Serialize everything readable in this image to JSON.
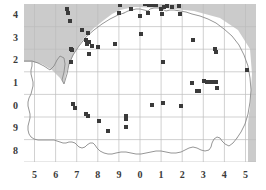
{
  "figure": {
    "type": "distribution-map"
  },
  "chart_data": {
    "type": "scatter",
    "title": "",
    "xlabel": "",
    "ylabel": "",
    "xlim": [
      4.5,
      15.5
    ],
    "ylim": [
      7.5,
      14.5
    ],
    "grid": true,
    "legend": null,
    "xtick_labels": [
      "5",
      "6",
      "7",
      "8",
      "9",
      "0",
      "1",
      "2",
      "3",
      "4",
      "5"
    ],
    "xtick_values": [
      5,
      6,
      7,
      8,
      9,
      10,
      11,
      12,
      13,
      14,
      15
    ],
    "ytick_labels": [
      "4",
      "3",
      "2",
      "1",
      "0",
      "9",
      "8"
    ],
    "ytick_values": [
      14,
      13,
      12,
      11,
      10,
      9,
      8
    ],
    "marker": "square",
    "marker_color": "#3a3a3a",
    "marker_size_px": 4,
    "sea_color": "#cccccc",
    "land_color": "#ffffff",
    "coast_color": "#808080",
    "grid_color": "#bcbcbc",
    "points": [
      [
        6.55,
        14.3
      ],
      [
        6.6,
        14.08
      ],
      [
        6.7,
        13.75
      ],
      [
        7.25,
        13.35
      ],
      [
        7.55,
        13.22
      ],
      [
        7.45,
        12.9
      ],
      [
        7.6,
        12.82
      ],
      [
        7.5,
        12.72
      ],
      [
        7.72,
        12.62
      ],
      [
        6.72,
        12.52
      ],
      [
        8.0,
        12.58
      ],
      [
        8.8,
        12.72
      ],
      [
        6.78,
        12.45
      ],
      [
        6.75,
        11.92
      ],
      [
        7.58,
        12.3
      ],
      [
        9.0,
        14.08
      ],
      [
        9.05,
        14.45
      ],
      [
        9.55,
        14.3
      ],
      [
        10.22,
        14.48
      ],
      [
        10.45,
        14.46
      ],
      [
        10.6,
        14.45
      ],
      [
        10.75,
        14.45
      ],
      [
        10.4,
        14.1
      ],
      [
        10.0,
        13.98
      ],
      [
        11.0,
        14.3
      ],
      [
        11.15,
        14.35
      ],
      [
        11.3,
        14.4
      ],
      [
        11.5,
        14.38
      ],
      [
        11.05,
        14.05
      ],
      [
        11.85,
        14.4
      ],
      [
        11.9,
        14.05
      ],
      [
        10.05,
        13.18
      ],
      [
        12.5,
        12.92
      ],
      [
        13.55,
        12.5
      ],
      [
        13.58,
        12.38
      ],
      [
        11.1,
        11.92
      ],
      [
        15.05,
        11.58
      ],
      [
        12.45,
        11.0
      ],
      [
        13.05,
        11.1
      ],
      [
        13.2,
        11.05
      ],
      [
        13.35,
        11.05
      ],
      [
        13.5,
        11.05
      ],
      [
        13.6,
        11.05
      ],
      [
        13.65,
        10.78
      ],
      [
        12.7,
        10.65
      ],
      [
        12.8,
        10.65
      ],
      [
        10.55,
        10.02
      ],
      [
        11.1,
        10.12
      ],
      [
        11.95,
        10.0
      ],
      [
        6.8,
        10.05
      ],
      [
        6.9,
        9.88
      ],
      [
        7.45,
        9.62
      ],
      [
        7.55,
        9.55
      ],
      [
        8.05,
        9.32
      ],
      [
        9.35,
        9.55
      ],
      [
        9.35,
        9.42
      ],
      [
        9.35,
        9.05
      ],
      [
        8.5,
        8.88
      ]
    ]
  }
}
